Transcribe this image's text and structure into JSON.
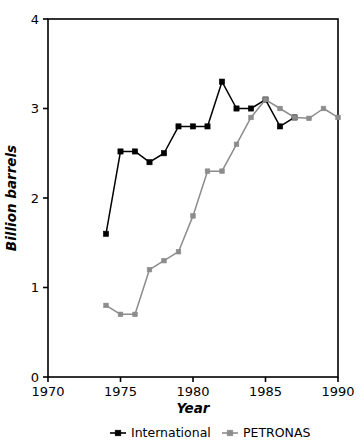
{
  "chart_data": {
    "type": "line",
    "title": "",
    "xlabel": "Year",
    "ylabel": "Billion barrels",
    "xlim": [
      1970,
      1990
    ],
    "ylim": [
      0,
      4
    ],
    "xticks": [
      1970,
      1975,
      1980,
      1985,
      1990
    ],
    "yticks": [
      0,
      1,
      2,
      3,
      4
    ],
    "xtick_labels": [
      "1970",
      "1975",
      "1980",
      "1985",
      "1990"
    ],
    "ytick_labels": [
      "0",
      "1",
      "2",
      "3",
      "4"
    ],
    "grid": false,
    "legend_position": "below",
    "series": [
      {
        "name": "International",
        "color": "#000000",
        "marker": "square",
        "x": [
          1974,
          1975,
          1976,
          1977,
          1978,
          1979,
          1980,
          1981,
          1982,
          1983,
          1984,
          1985,
          1986,
          1987
        ],
        "values": [
          1.6,
          2.52,
          2.52,
          2.4,
          2.5,
          2.8,
          2.8,
          2.8,
          3.3,
          3.0,
          3.0,
          3.1,
          2.8,
          2.9
        ]
      },
      {
        "name": "PETRONAS",
        "color": "#8c8c8c",
        "marker": "square",
        "x": [
          1974,
          1975,
          1976,
          1977,
          1978,
          1979,
          1980,
          1981,
          1982,
          1983,
          1984,
          1985,
          1986,
          1987,
          1988,
          1989,
          1990
        ],
        "values": [
          0.8,
          0.7,
          0.7,
          1.2,
          1.3,
          1.4,
          1.8,
          2.3,
          2.3,
          2.6,
          2.9,
          3.1,
          3.0,
          2.9,
          2.89,
          3.0,
          2.9
        ]
      }
    ]
  },
  "legend": {
    "items": [
      {
        "label": "International",
        "color": "#000000"
      },
      {
        "label": "PETRONAS",
        "color": "#8c8c8c"
      }
    ]
  },
  "colors": {
    "international": "#000000",
    "petronas": "#8c8c8c",
    "axis": "#000000",
    "background": "#ffffff"
  }
}
